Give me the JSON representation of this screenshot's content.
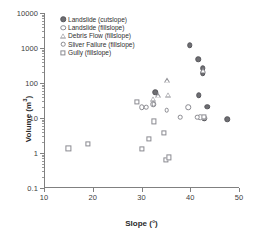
{
  "chart_data": {
    "type": "scatter",
    "title": "",
    "xlabel": "Slope (°)",
    "ylabel": "Volume (m³)",
    "xlim": [
      10,
      50
    ],
    "ylim": [
      0.1,
      10000
    ],
    "yscale": "log",
    "xscale": "linear",
    "xticks": [
      10,
      20,
      30,
      40,
      50
    ],
    "xticklabels": [
      "10",
      "20",
      "30",
      "40",
      "50"
    ],
    "yticks": [
      0.1,
      1,
      10,
      100,
      1000,
      10000
    ],
    "yticklabels": [
      "0.1",
      "1",
      "10",
      "100",
      "1000",
      "10000"
    ],
    "grid": false,
    "legend_position": "upper-left",
    "series": [
      {
        "name": "Landslide (cutslope)",
        "marker": "circle-filled",
        "color": "#6e6e72",
        "points": [
          {
            "x": 32.8,
            "y": 55
          },
          {
            "x": 39.9,
            "y": 1200
          },
          {
            "x": 41.6,
            "y": 480
          },
          {
            "x": 42.6,
            "y": 260
          },
          {
            "x": 42.6,
            "y": 190
          },
          {
            "x": 41.7,
            "y": 45
          },
          {
            "x": 43.5,
            "y": 21
          },
          {
            "x": 42.9,
            "y": 10
          },
          {
            "x": 47.6,
            "y": 9.3
          }
        ]
      },
      {
        "name": "Landslide (fillslope)",
        "marker": "circle-open",
        "color": "#8a8a90",
        "points": [
          {
            "x": 30.1,
            "y": 20
          },
          {
            "x": 32.4,
            "y": 25
          },
          {
            "x": 39.6,
            "y": 20
          },
          {
            "x": 42.0,
            "y": 10.5
          }
        ]
      },
      {
        "name": "Debris Flow (fillslope)",
        "marker": "triangle-open",
        "color": "#8a8a90",
        "points": [
          {
            "x": 32.3,
            "y": 36
          },
          {
            "x": 33.4,
            "y": 44
          },
          {
            "x": 35.3,
            "y": 120
          },
          {
            "x": 35.4,
            "y": 46
          },
          {
            "x": 42.7,
            "y": 230
          }
        ]
      },
      {
        "name": "Sliver Failure (fillslope)",
        "marker": "circle-small-open",
        "color": "#8a8a90",
        "points": [
          {
            "x": 31.0,
            "y": 20
          },
          {
            "x": 32.5,
            "y": 25
          },
          {
            "x": 35.2,
            "y": 17
          },
          {
            "x": 37.9,
            "y": 10.5
          },
          {
            "x": 41.4,
            "y": 10.5
          }
        ]
      },
      {
        "name": "Gully (fillslope)",
        "marker": "square-open",
        "color": "#8a8a90",
        "points": [
          {
            "x": 15.0,
            "y": 1.35
          },
          {
            "x": 19.0,
            "y": 1.8
          },
          {
            "x": 29.1,
            "y": 29
          },
          {
            "x": 30.0,
            "y": 1.3
          },
          {
            "x": 31.6,
            "y": 2.5
          },
          {
            "x": 32.5,
            "y": 8.0
          },
          {
            "x": 34.6,
            "y": 3.7
          },
          {
            "x": 35.0,
            "y": 0.65
          },
          {
            "x": 35.6,
            "y": 0.75
          },
          {
            "x": 42.8,
            "y": 10.5
          }
        ]
      }
    ]
  },
  "axes": {
    "y_label_parts": {
      "text": "Volume (m",
      "sup": "3",
      "tail": ")"
    },
    "x_label": "Slope (°)"
  },
  "legend": {
    "items": [
      {
        "label": "Landslide (cutslope)",
        "marker": "circle-filled"
      },
      {
        "label": "Landslide (fillslope)",
        "marker": "circle-open"
      },
      {
        "label": "Debris Flow (fillslope)",
        "marker": "triangle-open"
      },
      {
        "label": "Sliver Failure (fillslope)",
        "marker": "circle-small-open"
      },
      {
        "label": "Gully (fillslope)",
        "marker": "square-open"
      }
    ]
  }
}
